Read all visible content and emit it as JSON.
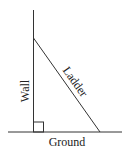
{
  "diagram": {
    "type": "right-triangle-ladder",
    "labels": {
      "wall": "Wall",
      "ladder": "Ladder",
      "ground": "Ground"
    },
    "right_angle_marker": true,
    "colors": {
      "line": "#333333",
      "text": "#222222",
      "background": "#ffffff"
    }
  }
}
